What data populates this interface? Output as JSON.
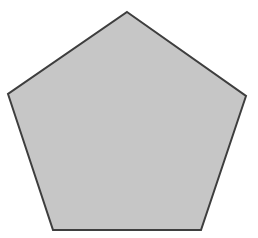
{
  "diagram": {
    "shape": "regular-pentagon",
    "points": [
      [
        127,
        12
      ],
      [
        246,
        96
      ],
      [
        201,
        230
      ],
      [
        53,
        230
      ],
      [
        8,
        94
      ]
    ],
    "fill": "#c6c6c6",
    "stroke": "#3e3e3e",
    "stroke_width": 2
  }
}
